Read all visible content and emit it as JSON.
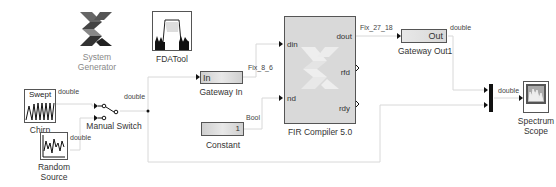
{
  "diagram": {
    "blocks": {
      "sysgen": {
        "label_line1": "System",
        "label_line2": "Generator",
        "icon": "xilinx-logo-icon"
      },
      "fdatool": {
        "label": "FDATool",
        "icon": "filter-response-icon"
      },
      "chirp": {
        "title": "Swept",
        "label": "Chirp",
        "icon": "chirp-wave-icon"
      },
      "random": {
        "label_line1": "Random",
        "label_line2": "Source",
        "icon": "random-signal-icon"
      },
      "switch": {
        "label": "Manual Switch",
        "icon": "switch-icon"
      },
      "gateway_in": {
        "text": "In",
        "label": "Gateway In"
      },
      "constant": {
        "text": "1",
        "label": "Constant"
      },
      "fir": {
        "label": "FIR Compiler 5.0",
        "ports_in": [
          "din",
          "nd"
        ],
        "ports_out": [
          "dout",
          "rfd",
          "rdy"
        ]
      },
      "gateway_out": {
        "text": "Out",
        "label": "Gateway Out1"
      },
      "mux": {
        "label": ""
      },
      "scope": {
        "label_line1": "Spectrum",
        "label_line2": "Scope",
        "icon": "spectrum-scope-icon"
      }
    },
    "signals": {
      "chirp_out": "double",
      "random_out": "double",
      "switch_out": "double",
      "gateway_in_out": "Fix_8_6",
      "constant_out": "Bool",
      "fir_dout": "Fix_27_18",
      "gateway_out_out": "double",
      "mux_out": "double"
    }
  }
}
